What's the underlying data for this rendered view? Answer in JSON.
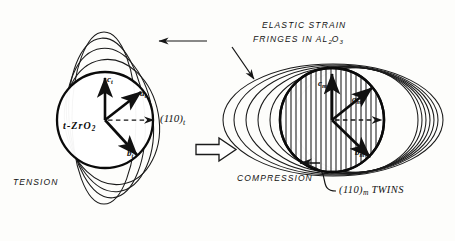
{
  "figure": {
    "background_color": "#fdfdfb",
    "ink_color": "#111111"
  },
  "annotations": {
    "elastic_line1": "ELASTIC  STRAIN",
    "elastic_line2_prefix": "FRINGES   IN  AL",
    "elastic_sub_2": "2",
    "elastic_mid_O": "O",
    "elastic_sub_3": "3",
    "tension": "TENSION",
    "compression": "COMPRESSION",
    "twins_plane": "(110)",
    "twins_sub": "m",
    "twins_word": "TWINS"
  },
  "left_figure": {
    "name": "tetragonal-zirconia-particle",
    "phase_label_prefix": "t-ZrO",
    "phase_label_sub": "2",
    "plane_label": "(110)",
    "plane_label_sub": "t",
    "state": "TENSION",
    "fringe_count": 4,
    "fringe_orientation": "vertical-ellipses",
    "circle": {
      "cx": 105,
      "cy": 120,
      "r": 48
    },
    "vectors": [
      {
        "name": "c-axis",
        "label": "c",
        "sub": "t",
        "angle_deg": 90,
        "length": 46
      },
      {
        "name": "a-axis",
        "label": "a",
        "sub": "t",
        "angle_deg": 38,
        "length": 46
      },
      {
        "name": "b-axis",
        "label": "b",
        "sub": "t",
        "angle_deg": -52,
        "length": 46
      }
    ],
    "dashed_arrow": {
      "name": "plane-normal-arrow",
      "direction": "right",
      "length": 48
    }
  },
  "right_figure": {
    "name": "monoclinic-zirconia-particle",
    "state": "COMPRESSION",
    "fringe_count": 7,
    "fringe_orientation": "horizontal-ellipses",
    "twin_hatching": true,
    "twin_line_count": 17,
    "circle": {
      "cx": 332,
      "cy": 120,
      "r": 52
    },
    "vectors": [
      {
        "name": "c-axis",
        "label": "c",
        "sub": "m",
        "angle_deg": 90,
        "length": 50
      },
      {
        "name": "a-axis",
        "label": "a",
        "sub": "m",
        "angle_deg": 40,
        "length": 50
      },
      {
        "name": "b-axis",
        "label": "b",
        "sub": "m",
        "angle_deg": -50,
        "length": 50
      }
    ],
    "dashed_arrow": {
      "name": "plane-normal-arrow",
      "direction": "right",
      "length": 52
    }
  },
  "transform_arrow": {
    "name": "transformation-arrow",
    "style": "hollow-block-arrow",
    "direction": "right",
    "x": 196,
    "y": 149
  },
  "leader_arrows": [
    {
      "name": "elastic-strain-leader-left",
      "from": [
        207,
        41
      ],
      "to": [
        160,
        41
      ],
      "target": "left-figure-fringes"
    },
    {
      "name": "elastic-strain-leader-right",
      "from": [
        233,
        48
      ],
      "to": [
        253,
        76
      ],
      "target": "right-figure-fringes"
    },
    {
      "name": "twins-leader",
      "from": [
        336,
        192
      ],
      "to": [
        300,
        162
      ],
      "target": "right-figure-twins"
    }
  ]
}
